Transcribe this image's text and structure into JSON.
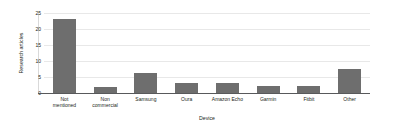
{
  "chart_data": {
    "type": "bar",
    "title": "",
    "xlabel": "Device",
    "ylabel": "Research articles",
    "categories": [
      "Not\nmentioned",
      "Non\ncommercial",
      "Samsung",
      "Oura",
      "Amazon Echo",
      "Garmin",
      "Fitbit",
      "Other"
    ],
    "values": [
      23,
      2,
      6.2,
      3.2,
      3.2,
      2.3,
      2.3,
      7.5
    ],
    "ylim": [
      0,
      25
    ],
    "yticks": [
      0,
      5,
      10,
      15,
      20,
      25
    ],
    "ytick_labels": [
      "0",
      "5",
      "10",
      "15",
      "20",
      "25"
    ],
    "grid": true,
    "legend": false,
    "bar_color": "#6e6e6e",
    "grid_color": "#e8e8e8",
    "axis_color": "#58595b",
    "background": "#ffffff"
  }
}
